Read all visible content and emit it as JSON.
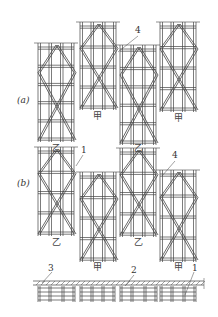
{
  "figure": {
    "panel_a": {
      "label": "(a)",
      "frames": [
        {
          "type": "乙",
          "x": 38,
          "top": 43,
          "bottom": 142
        },
        {
          "type": "甲",
          "x": 80,
          "top": 22,
          "bottom": 110
        },
        {
          "type": "乙",
          "x": 120,
          "top": 45,
          "bottom": 145
        },
        {
          "type": "甲",
          "x": 160,
          "top": 22,
          "bottom": 112
        }
      ],
      "callouts": [
        {
          "text": "4"
        }
      ]
    },
    "panel_b": {
      "label": "(b)",
      "frames": [
        {
          "type": "乙",
          "x": 38,
          "top": 147,
          "bottom": 236
        },
        {
          "type": "甲",
          "x": 80,
          "top": 172,
          "bottom": 262
        },
        {
          "type": "乙",
          "x": 120,
          "top": 148,
          "bottom": 237
        },
        {
          "type": "甲",
          "x": 160,
          "top": 170,
          "bottom": 262
        }
      ],
      "callouts": [
        {
          "text": "1"
        },
        {
          "text": "4"
        }
      ]
    },
    "plan": {
      "callouts": [
        {
          "text": "3"
        },
        {
          "text": "2"
        },
        {
          "text": "1"
        }
      ]
    }
  },
  "labels": {
    "a_label": "(a)",
    "b_label": "(b)",
    "a_frame_1": "乙",
    "a_frame_2": "甲",
    "a_frame_3": "乙",
    "a_frame_4": "甲",
    "b_frame_1": "乙",
    "b_frame_2": "甲",
    "b_frame_3": "乙",
    "b_frame_4": "甲",
    "a_callout_4": "4",
    "b_callout_1": "1",
    "b_callout_4": "4",
    "plan_callout_3": "3",
    "plan_callout_2": "2",
    "plan_callout_1": "1"
  },
  "colors": {
    "line": "#444444",
    "background": "#ffffff"
  }
}
